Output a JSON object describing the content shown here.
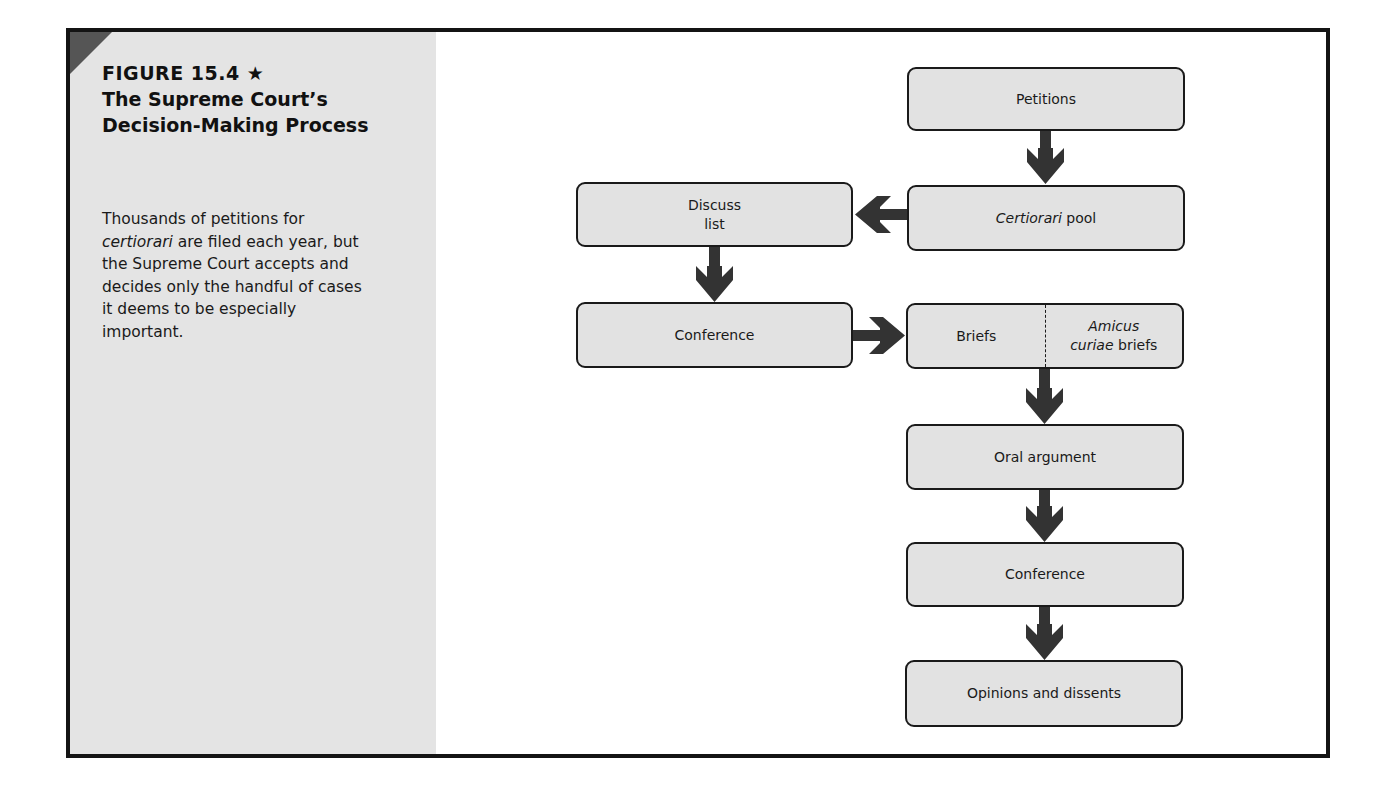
{
  "figure": {
    "number": "FIGURE 15.4 ★",
    "title": "The Supreme Court’s Decision-Making Process",
    "caption": {
      "part1": "Thousands of petitions for ",
      "italic": "certiorari",
      "part2": " are filed each year, but the Supreme Court accepts and decides only the handful of cases it deems to be especially important."
    }
  },
  "diagram": {
    "type": "flowchart",
    "nodes": {
      "petitions": {
        "label": "Petitions"
      },
      "cert_pool": {
        "label_italic": "Certiorari",
        "label_rest": " pool"
      },
      "discuss_list": {
        "label_line1": "Discuss",
        "label_line2": "list"
      },
      "conference_1": {
        "label": "Conference"
      },
      "briefs": {
        "left_label": "Briefs",
        "right_label_italic_line1": "Amicus",
        "right_label_italic_line2": "curiae",
        "right_label_rest": " briefs"
      },
      "oral_argument": {
        "label": "Oral argument"
      },
      "conference_2": {
        "label": "Conference"
      },
      "opinions": {
        "label": "Opinions and dissents"
      }
    },
    "edges": [
      {
        "from": "Petitions",
        "to": "Certiorari pool",
        "direction": "down"
      },
      {
        "from": "Certiorari pool",
        "to": "Discuss list",
        "direction": "left"
      },
      {
        "from": "Discuss list",
        "to": "Conference",
        "direction": "down"
      },
      {
        "from": "Conference",
        "to": "Briefs / Amicus curiae briefs",
        "direction": "right"
      },
      {
        "from": "Briefs / Amicus curiae briefs",
        "to": "Oral argument",
        "direction": "down"
      },
      {
        "from": "Oral argument",
        "to": "Conference",
        "direction": "down"
      },
      {
        "from": "Conference",
        "to": "Opinions and dissents",
        "direction": "down"
      }
    ],
    "colors": {
      "box_fill": "#e2e2e2",
      "box_border": "#1a1a1a",
      "arrow": "#333333",
      "sidebar": "#e4e4e4",
      "corner": "#555555"
    }
  }
}
